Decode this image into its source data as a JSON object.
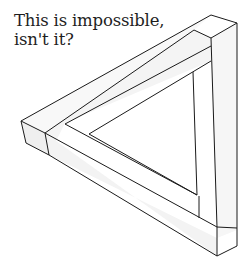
{
  "caption": {
    "line1": "This is impossible,",
    "line2": "isn't it?"
  },
  "figure": {
    "stroke_color": "#1a1a1a",
    "face_light": "#fbfbfb",
    "face_shade": "#f1f1f1"
  }
}
